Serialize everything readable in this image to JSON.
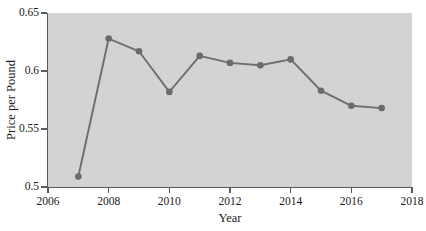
{
  "chart_data": {
    "type": "line",
    "title": "",
    "xlabel": "Year",
    "ylabel": "Price per Pound",
    "x": [
      2007,
      2008,
      2009,
      2010,
      2011,
      2012,
      2013,
      2014,
      2015,
      2016,
      2017
    ],
    "values": [
      0.509,
      0.628,
      0.617,
      0.582,
      0.613,
      0.607,
      0.605,
      0.61,
      0.583,
      0.57,
      0.568
    ],
    "series": [
      {
        "name": "Price per Pound",
        "values": [
          0.509,
          0.628,
          0.617,
          0.582,
          0.613,
          0.607,
          0.605,
          0.61,
          0.583,
          0.57,
          0.568
        ]
      }
    ],
    "xlim": [
      2006,
      2018
    ],
    "ylim": [
      0.5,
      0.65
    ],
    "xticks": [
      2006,
      2008,
      2010,
      2012,
      2014,
      2016,
      2018
    ],
    "xticklabels": [
      "2006",
      "2008",
      "2010",
      "2012",
      "2014",
      "2016",
      "2018"
    ],
    "yticks": [
      0.5,
      0.55,
      0.6,
      0.65
    ],
    "yticklabels": [
      "0.5",
      "0.55",
      "0.6",
      "0.65"
    ],
    "grid": false,
    "legend": null,
    "marker": "circle",
    "line_color": "#6e6e6e",
    "marker_color": "#6b6b6b",
    "plot_background": "#d3d3d3",
    "figure_background": "#ffffff"
  },
  "axes": {
    "y_title": "Price per Pound",
    "x_title": "Year"
  }
}
